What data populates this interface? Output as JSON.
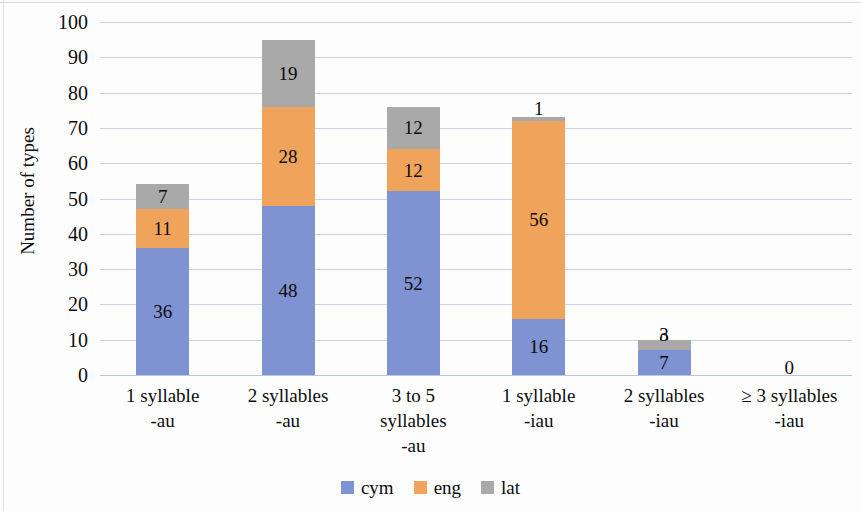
{
  "chart_data": {
    "type": "bar",
    "subtype": "stacked-bar",
    "title": "",
    "xlabel": "",
    "ylabel": "Number of types",
    "ylim": [
      0,
      100
    ],
    "ytick_step": 10,
    "yticks": [
      100,
      90,
      80,
      70,
      60,
      50,
      40,
      30,
      20,
      10,
      0
    ],
    "grid": true,
    "legend_position": "bottom",
    "categories": [
      "1 syllable\n-au",
      "2 syllables\n-au",
      "3 to 5 syllables\n-au",
      "1 syllable\n-iau",
      "2 syllables\n-iau",
      "≥ 3 syllables\n-iau"
    ],
    "category_lines": [
      [
        "1 syllable",
        "-au"
      ],
      [
        "2 syllables",
        "-au"
      ],
      [
        "3 to 5",
        "syllables",
        "-au"
      ],
      [
        "1 syllable",
        "-iau"
      ],
      [
        "2 syllables",
        "-iau"
      ],
      [
        "≥ 3 syllables",
        "-iau"
      ]
    ],
    "series": [
      {
        "name": "cym",
        "color": "#7f92d1",
        "values": [
          36,
          48,
          52,
          16,
          7,
          0
        ]
      },
      {
        "name": "eng",
        "color": "#f0a35a",
        "values": [
          11,
          28,
          12,
          56,
          0,
          0
        ]
      },
      {
        "name": "lat",
        "color": "#a9a9a9",
        "values": [
          7,
          19,
          12,
          1,
          3,
          0
        ]
      }
    ],
    "totals": [
      54,
      95,
      76,
      73,
      10,
      0
    ],
    "bar_labels": [
      [
        "36",
        "11",
        "7"
      ],
      [
        "48",
        "28",
        "19"
      ],
      [
        "52",
        "12",
        "12"
      ],
      [
        "16",
        "56",
        "1"
      ],
      [
        "7",
        "0",
        "3"
      ],
      [
        "0",
        "",
        ""
      ]
    ],
    "empty_bar_label": "0"
  },
  "legend": {
    "items": [
      {
        "label": "cym",
        "color": "#7f92d1"
      },
      {
        "label": "eng",
        "color": "#f0a35a"
      },
      {
        "label": "lat",
        "color": "#a9a9a9"
      }
    ]
  },
  "axis": {
    "y_title": "Number of types"
  }
}
